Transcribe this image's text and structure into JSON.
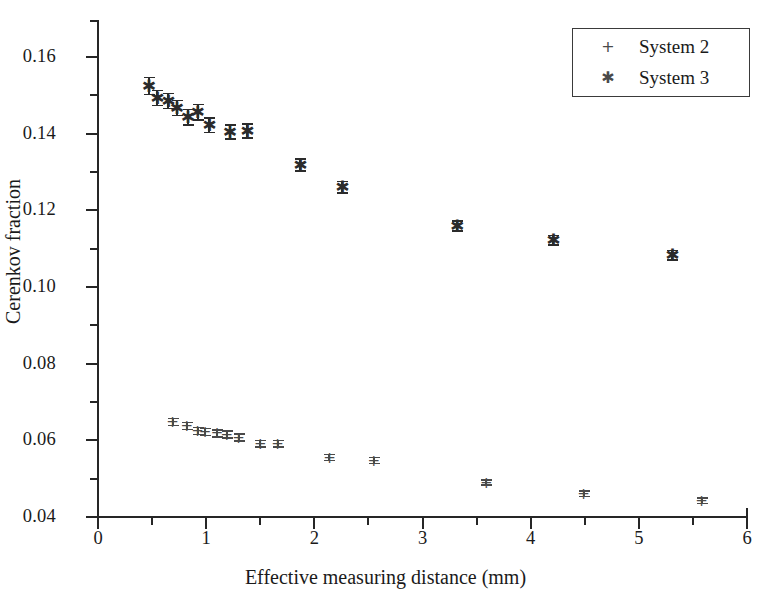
{
  "chart_data": {
    "type": "scatter",
    "title": "",
    "xlabel": "Effective measuring distance (mm)",
    "ylabel": "Cerenkov fraction",
    "xlim": [
      0,
      6
    ],
    "ylim": [
      0.04,
      0.168
    ],
    "grid": false,
    "legend_position": "top-right",
    "xticks": [
      0,
      1,
      2,
      3,
      4,
      5,
      6
    ],
    "xtick_labels": [
      "0",
      "1",
      "2",
      "3",
      "4",
      "5",
      "6"
    ],
    "xminor_step": 0.5,
    "yticks": [
      0.04,
      0.06,
      0.08,
      0.1,
      0.12,
      0.14,
      0.16
    ],
    "ytick_labels": [
      "0.04",
      "0.06",
      "0.08",
      "0.10",
      "0.12",
      "0.14",
      "0.16"
    ],
    "yminor_step": 0.01,
    "series": [
      {
        "name": "System 2",
        "marker": "plus",
        "marker_glyph": "+",
        "color": "#4a4a4a",
        "points": [
          {
            "x": 0.69,
            "y": 0.0648,
            "yerr": 0.0009
          },
          {
            "x": 0.82,
            "y": 0.0637,
            "yerr": 0.0009
          },
          {
            "x": 0.92,
            "y": 0.0624,
            "yerr": 0.0009
          },
          {
            "x": 0.99,
            "y": 0.0622,
            "yerr": 0.0009
          },
          {
            "x": 1.1,
            "y": 0.0618,
            "yerr": 0.0009
          },
          {
            "x": 1.19,
            "y": 0.0615,
            "yerr": 0.0009
          },
          {
            "x": 1.3,
            "y": 0.0607,
            "yerr": 0.0009
          },
          {
            "x": 1.5,
            "y": 0.0591,
            "yerr": 0.0008
          },
          {
            "x": 1.66,
            "y": 0.0591,
            "yerr": 0.0008
          },
          {
            "x": 2.14,
            "y": 0.0555,
            "yerr": 0.0008
          },
          {
            "x": 2.55,
            "y": 0.0547,
            "yerr": 0.0008
          },
          {
            "x": 3.59,
            "y": 0.049,
            "yerr": 0.0007
          },
          {
            "x": 4.49,
            "y": 0.0461,
            "yerr": 0.0007
          },
          {
            "x": 5.58,
            "y": 0.0442,
            "yerr": 0.0007
          }
        ]
      },
      {
        "name": "System 3",
        "marker": "asterisk",
        "marker_glyph": "✱",
        "color": "#2b2b2b",
        "points": [
          {
            "x": 0.47,
            "y": 0.1524,
            "yerr": 0.0022
          },
          {
            "x": 0.55,
            "y": 0.1493,
            "yerr": 0.002
          },
          {
            "x": 0.65,
            "y": 0.1485,
            "yerr": 0.002
          },
          {
            "x": 0.73,
            "y": 0.1467,
            "yerr": 0.002
          },
          {
            "x": 0.83,
            "y": 0.1443,
            "yerr": 0.002
          },
          {
            "x": 0.92,
            "y": 0.1456,
            "yerr": 0.002
          },
          {
            "x": 1.03,
            "y": 0.1422,
            "yerr": 0.0019
          },
          {
            "x": 1.22,
            "y": 0.1404,
            "yerr": 0.0018
          },
          {
            "x": 1.38,
            "y": 0.1407,
            "yerr": 0.0018
          },
          {
            "x": 1.87,
            "y": 0.1318,
            "yerr": 0.0016
          },
          {
            "x": 2.26,
            "y": 0.126,
            "yerr": 0.0015
          },
          {
            "x": 3.32,
            "y": 0.1159,
            "yerr": 0.0013
          },
          {
            "x": 4.21,
            "y": 0.1122,
            "yerr": 0.0013
          },
          {
            "x": 5.31,
            "y": 0.1083,
            "yerr": 0.0012
          }
        ]
      }
    ]
  }
}
